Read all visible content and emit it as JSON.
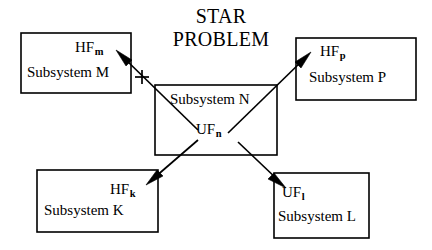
{
  "diagram": {
    "title": {
      "line_1": "STAR",
      "line_2": "PROBLEM"
    },
    "boxes": [
      {
        "id": "subsystem-m",
        "flow_label_base": "HF",
        "flow_label_sub": "m",
        "name": "Subsystem M"
      },
      {
        "id": "subsystem-p",
        "flow_label_base": "HF",
        "flow_label_sub": "p",
        "name": "Subsystem P"
      },
      {
        "id": "subsystem-n",
        "flow_label_base": "UF",
        "flow_label_sub": "n",
        "name": "Subsystem N"
      },
      {
        "id": "subsystem-k",
        "flow_label_base": "HF",
        "flow_label_sub": "k",
        "name": "Subsystem K"
      },
      {
        "id": "subsystem-l",
        "flow_label_base": "UF",
        "flow_label_sub": "l",
        "name": "Subsystem L"
      }
    ],
    "annotations": {
      "plus_sign": "+"
    },
    "colors": {
      "stroke": "#000000",
      "fill": "#ffffff",
      "text": "#000000"
    }
  }
}
